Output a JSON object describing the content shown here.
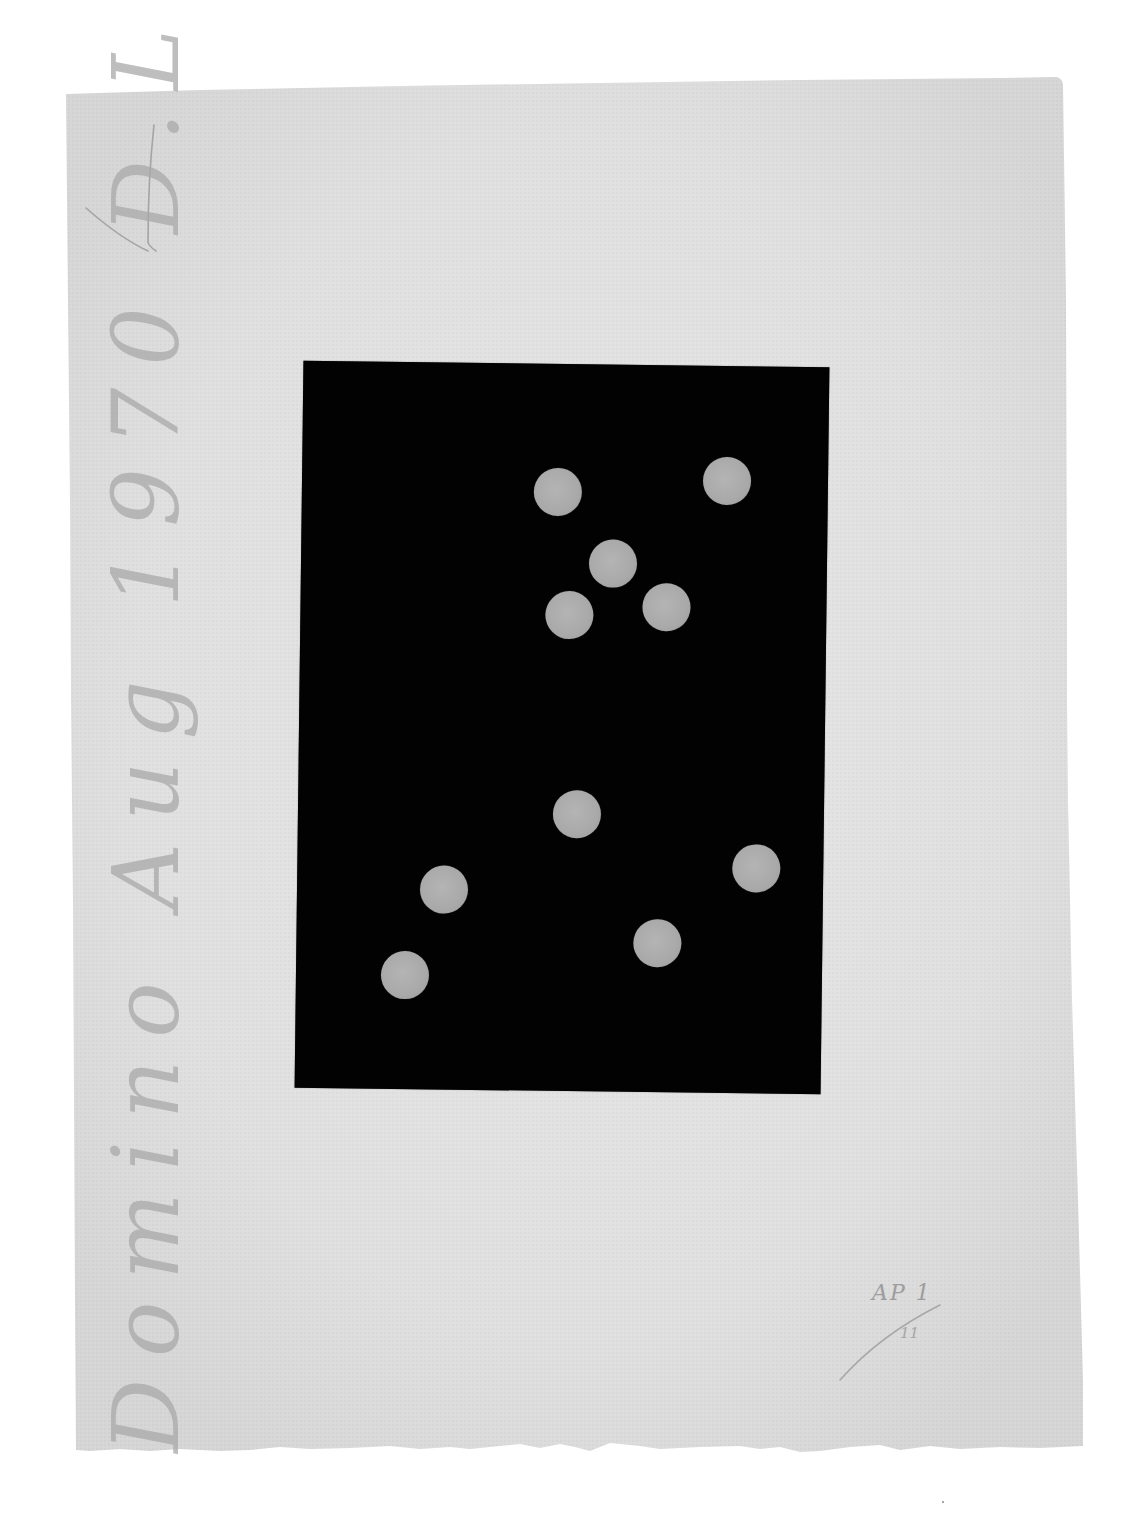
{
  "artwork": {
    "description": "Print on deckle-edged paper: black rectangle with ten grey dots",
    "colors": {
      "background": "#ffffff",
      "paper": "#e3e3e3",
      "paper_shadow": "#d4d4d4",
      "plate": "#020202",
      "dot": "#aaaaaa",
      "pencil": "#a8a8a8"
    },
    "paper": {
      "corners": {
        "top_left": [
          66,
          92
        ],
        "top_right": [
          1062,
          78
        ],
        "bottom_right": [
          1083,
          1452
        ],
        "bottom_left": [
          75,
          1452
        ]
      }
    },
    "plate": {
      "bounds": {
        "left": 299,
        "top": 364,
        "width": 526,
        "height": 727
      },
      "rotation_deg": 0.7
    },
    "dots": [
      {
        "id": "dot-1",
        "x": 555,
        "y": 492
      },
      {
        "id": "dot-2",
        "x": 724,
        "y": 479
      },
      {
        "id": "dot-3",
        "x": 611,
        "y": 563
      },
      {
        "id": "dot-4",
        "x": 568,
        "y": 615
      },
      {
        "id": "dot-5",
        "x": 665,
        "y": 606
      },
      {
        "id": "dot-6",
        "x": 578,
        "y": 814
      },
      {
        "id": "dot-7",
        "x": 758,
        "y": 866
      },
      {
        "id": "dot-8",
        "x": 446,
        "y": 891
      },
      {
        "id": "dot-9",
        "x": 660,
        "y": 942
      },
      {
        "id": "dot-10",
        "x": 408,
        "y": 977
      }
    ],
    "dot_diameter": 48
  },
  "inscriptions": {
    "title_date_initials": "Domino Aug 1970 D.L",
    "edition_top": "AP 1",
    "edition_bottom": "11"
  }
}
